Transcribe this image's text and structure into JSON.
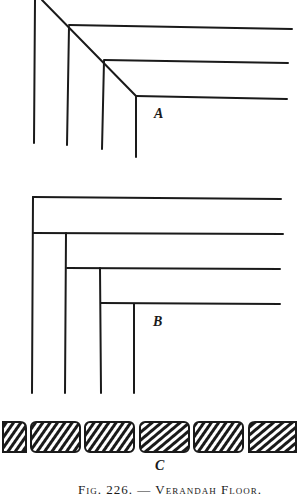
{
  "figure": {
    "number": "226",
    "caption": "Fig. 226. — Verandah Floor.",
    "panels": [
      {
        "id": "A",
        "label": "A",
        "description": "Mitred corner joint of floor boards"
      },
      {
        "id": "B",
        "label": "B",
        "description": "Butt-jointed corner of floor boards"
      },
      {
        "id": "C",
        "label": "C",
        "description": "Cross-section of rounded floor boards showing grain"
      }
    ]
  },
  "colors": {
    "ink": "#1a1a1a",
    "paper": "#ffffff"
  }
}
